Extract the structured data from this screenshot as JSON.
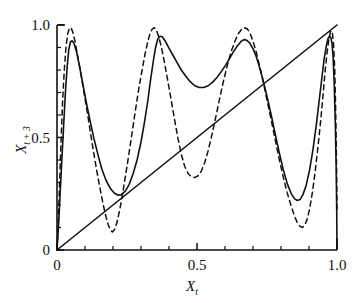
{
  "chart_data": {
    "type": "line",
    "title": "",
    "xlabel": "X_t",
    "ylabel": "X_t+3",
    "xlabel_base": "X",
    "xlabel_sub": "t",
    "ylabel_base": "X",
    "ylabel_sub": "t + 3",
    "xlim": [
      0,
      1.0
    ],
    "ylim": [
      0,
      1.0
    ],
    "grid": false,
    "legend": "none",
    "xticks": [
      0,
      0.5,
      1.0
    ],
    "xticklabels": [
      "0",
      "0.5",
      "1.0"
    ],
    "yticks": [
      0,
      0.5,
      1.0
    ],
    "yticklabels": [
      "0",
      "0.5",
      "1.0"
    ],
    "x_minor_ticks": [
      0.1,
      0.2,
      0.3,
      0.4,
      0.6,
      0.7,
      0.8,
      0.9
    ],
    "y_minor_ticks": [
      0.1,
      0.2,
      0.3,
      0.4,
      0.6,
      0.7,
      0.8,
      0.9
    ],
    "series": [
      {
        "name": "solid-curve",
        "style": "solid",
        "color": "#111111",
        "points": [
          [
            0.0,
            0.0
          ],
          [
            0.006,
            0.12
          ],
          [
            0.012,
            0.27
          ],
          [
            0.018,
            0.42
          ],
          [
            0.024,
            0.56
          ],
          [
            0.03,
            0.7
          ],
          [
            0.036,
            0.81
          ],
          [
            0.042,
            0.89
          ],
          [
            0.048,
            0.925
          ],
          [
            0.054,
            0.93
          ],
          [
            0.06,
            0.92
          ],
          [
            0.07,
            0.88
          ],
          [
            0.08,
            0.82
          ],
          [
            0.092,
            0.74
          ],
          [
            0.104,
            0.66
          ],
          [
            0.118,
            0.575
          ],
          [
            0.132,
            0.495
          ],
          [
            0.146,
            0.425
          ],
          [
            0.16,
            0.36
          ],
          [
            0.175,
            0.31
          ],
          [
            0.19,
            0.275
          ],
          [
            0.205,
            0.252
          ],
          [
            0.218,
            0.243
          ],
          [
            0.23,
            0.246
          ],
          [
            0.244,
            0.262
          ],
          [
            0.258,
            0.292
          ],
          [
            0.272,
            0.34
          ],
          [
            0.286,
            0.4
          ],
          [
            0.3,
            0.48
          ],
          [
            0.312,
            0.565
          ],
          [
            0.324,
            0.66
          ],
          [
            0.334,
            0.755
          ],
          [
            0.344,
            0.84
          ],
          [
            0.352,
            0.9
          ],
          [
            0.36,
            0.938
          ],
          [
            0.368,
            0.95
          ],
          [
            0.376,
            0.948
          ],
          [
            0.386,
            0.93
          ],
          [
            0.398,
            0.902
          ],
          [
            0.412,
            0.87
          ],
          [
            0.428,
            0.835
          ],
          [
            0.444,
            0.8
          ],
          [
            0.46,
            0.772
          ],
          [
            0.476,
            0.748
          ],
          [
            0.492,
            0.73
          ],
          [
            0.508,
            0.722
          ],
          [
            0.524,
            0.722
          ],
          [
            0.54,
            0.73
          ],
          [
            0.556,
            0.746
          ],
          [
            0.572,
            0.768
          ],
          [
            0.588,
            0.795
          ],
          [
            0.604,
            0.825
          ],
          [
            0.618,
            0.855
          ],
          [
            0.632,
            0.885
          ],
          [
            0.646,
            0.91
          ],
          [
            0.658,
            0.928
          ],
          [
            0.668,
            0.935
          ],
          [
            0.678,
            0.932
          ],
          [
            0.688,
            0.92
          ],
          [
            0.7,
            0.895
          ],
          [
            0.712,
            0.858
          ],
          [
            0.724,
            0.81
          ],
          [
            0.738,
            0.745
          ],
          [
            0.752,
            0.672
          ],
          [
            0.766,
            0.595
          ],
          [
            0.78,
            0.512
          ],
          [
            0.794,
            0.432
          ],
          [
            0.808,
            0.358
          ],
          [
            0.822,
            0.296
          ],
          [
            0.836,
            0.252
          ],
          [
            0.848,
            0.228
          ],
          [
            0.858,
            0.22
          ],
          [
            0.868,
            0.224
          ],
          [
            0.878,
            0.245
          ],
          [
            0.89,
            0.288
          ],
          [
            0.902,
            0.355
          ],
          [
            0.914,
            0.445
          ],
          [
            0.926,
            0.555
          ],
          [
            0.936,
            0.66
          ],
          [
            0.946,
            0.765
          ],
          [
            0.954,
            0.848
          ],
          [
            0.962,
            0.908
          ],
          [
            0.968,
            0.94
          ],
          [
            0.974,
            0.95
          ],
          [
            0.978,
            0.944
          ],
          [
            0.982,
            0.92
          ],
          [
            0.986,
            0.86
          ],
          [
            0.99,
            0.74
          ],
          [
            0.994,
            0.56
          ],
          [
            0.997,
            0.37
          ],
          [
            0.999,
            0.17
          ],
          [
            1.0,
            0.01
          ]
        ]
      },
      {
        "name": "dashed-curve",
        "style": "dashed",
        "color": "#111111",
        "points": [
          [
            0.0,
            0.0
          ],
          [
            0.005,
            0.14
          ],
          [
            0.01,
            0.32
          ],
          [
            0.015,
            0.5
          ],
          [
            0.02,
            0.66
          ],
          [
            0.026,
            0.8
          ],
          [
            0.032,
            0.9
          ],
          [
            0.038,
            0.96
          ],
          [
            0.044,
            0.985
          ],
          [
            0.05,
            0.988
          ],
          [
            0.056,
            0.97
          ],
          [
            0.064,
            0.93
          ],
          [
            0.072,
            0.875
          ],
          [
            0.082,
            0.805
          ],
          [
            0.094,
            0.718
          ],
          [
            0.106,
            0.628
          ],
          [
            0.118,
            0.534
          ],
          [
            0.13,
            0.44
          ],
          [
            0.142,
            0.352
          ],
          [
            0.154,
            0.272
          ],
          [
            0.164,
            0.208
          ],
          [
            0.174,
            0.152
          ],
          [
            0.183,
            0.112
          ],
          [
            0.191,
            0.088
          ],
          [
            0.198,
            0.08
          ],
          [
            0.206,
            0.092
          ],
          [
            0.214,
            0.122
          ],
          [
            0.223,
            0.172
          ],
          [
            0.233,
            0.24
          ],
          [
            0.244,
            0.325
          ],
          [
            0.256,
            0.42
          ],
          [
            0.268,
            0.52
          ],
          [
            0.28,
            0.62
          ],
          [
            0.292,
            0.716
          ],
          [
            0.304,
            0.8
          ],
          [
            0.314,
            0.868
          ],
          [
            0.324,
            0.925
          ],
          [
            0.332,
            0.962
          ],
          [
            0.34,
            0.982
          ],
          [
            0.348,
            0.988
          ],
          [
            0.356,
            0.975
          ],
          [
            0.364,
            0.945
          ],
          [
            0.374,
            0.895
          ],
          [
            0.384,
            0.832
          ],
          [
            0.396,
            0.75
          ],
          [
            0.408,
            0.665
          ],
          [
            0.42,
            0.578
          ],
          [
            0.432,
            0.496
          ],
          [
            0.444,
            0.425
          ],
          [
            0.456,
            0.372
          ],
          [
            0.468,
            0.34
          ],
          [
            0.48,
            0.325
          ],
          [
            0.492,
            0.322
          ],
          [
            0.504,
            0.33
          ],
          [
            0.516,
            0.352
          ],
          [
            0.528,
            0.39
          ],
          [
            0.54,
            0.442
          ],
          [
            0.552,
            0.505
          ],
          [
            0.566,
            0.585
          ],
          [
            0.58,
            0.668
          ],
          [
            0.594,
            0.748
          ],
          [
            0.608,
            0.82
          ],
          [
            0.622,
            0.882
          ],
          [
            0.636,
            0.93
          ],
          [
            0.648,
            0.962
          ],
          [
            0.66,
            0.982
          ],
          [
            0.67,
            0.988
          ],
          [
            0.68,
            0.982
          ],
          [
            0.69,
            0.962
          ],
          [
            0.7,
            0.928
          ],
          [
            0.712,
            0.878
          ],
          [
            0.724,
            0.815
          ],
          [
            0.738,
            0.738
          ],
          [
            0.752,
            0.655
          ],
          [
            0.766,
            0.572
          ],
          [
            0.78,
            0.486
          ],
          [
            0.794,
            0.402
          ],
          [
            0.808,
            0.325
          ],
          [
            0.822,
            0.255
          ],
          [
            0.836,
            0.196
          ],
          [
            0.848,
            0.152
          ],
          [
            0.858,
            0.122
          ],
          [
            0.868,
            0.105
          ],
          [
            0.876,
            0.1
          ],
          [
            0.884,
            0.108
          ],
          [
            0.893,
            0.135
          ],
          [
            0.902,
            0.182
          ],
          [
            0.912,
            0.255
          ],
          [
            0.922,
            0.348
          ],
          [
            0.932,
            0.458
          ],
          [
            0.942,
            0.578
          ],
          [
            0.951,
            0.7
          ],
          [
            0.958,
            0.8
          ],
          [
            0.965,
            0.882
          ],
          [
            0.971,
            0.938
          ],
          [
            0.976,
            0.968
          ],
          [
            0.98,
            0.975
          ],
          [
            0.984,
            0.96
          ],
          [
            0.988,
            0.912
          ],
          [
            0.992,
            0.8
          ],
          [
            0.995,
            0.64
          ],
          [
            0.998,
            0.42
          ],
          [
            1.0,
            0.18
          ]
        ]
      },
      {
        "name": "identity-line",
        "style": "solid",
        "color": "#111111",
        "points": [
          [
            0.0,
            0.0
          ],
          [
            1.0,
            1.0
          ]
        ]
      }
    ]
  },
  "axes": {
    "x_label_text": "X",
    "x_label_sub": "t",
    "y_label_text": "X",
    "y_label_sub": "t + 3"
  }
}
